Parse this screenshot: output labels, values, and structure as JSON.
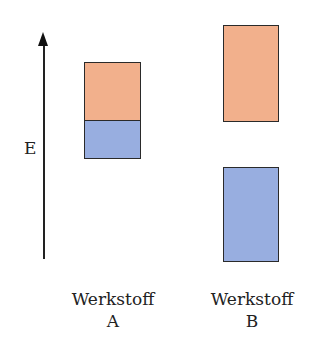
{
  "axis": {
    "label": "E",
    "direction": "up"
  },
  "colors": {
    "upper": "#f2b08c",
    "lower": "#98aee0",
    "border": "#2a2a2a"
  },
  "materials": [
    {
      "name": "Werkstoff",
      "letter": "A",
      "upper_band": "orange",
      "lower_band": "blue",
      "gap": false
    },
    {
      "name": "Werkstoff",
      "letter": "B",
      "upper_band": "orange",
      "lower_band": "blue",
      "gap": true
    }
  ]
}
